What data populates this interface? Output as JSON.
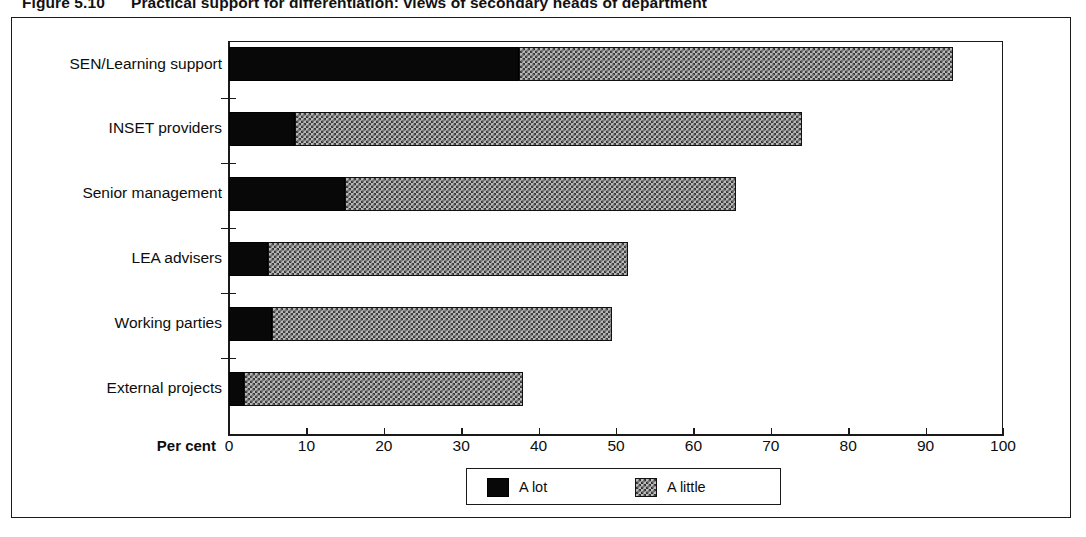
{
  "figure": {
    "number": "Figure 5.10",
    "title": "Practical support for differentiation: views of secondary heads of department"
  },
  "axis": {
    "x_title": "Per cent",
    "x_ticks": [
      "0",
      "10",
      "20",
      "30",
      "40",
      "50",
      "60",
      "70",
      "80",
      "90",
      "100"
    ]
  },
  "legend": {
    "items": [
      {
        "label": "A lot",
        "swatch": "solid-black-swatch"
      },
      {
        "label": "A little",
        "swatch": "checkered-grey-swatch"
      }
    ]
  },
  "chart_data": {
    "type": "bar",
    "orientation": "horizontal",
    "stacked": true,
    "title": "Practical support for differentiation: views of secondary heads of department",
    "xlabel": "Per cent",
    "ylabel": "",
    "xlim": [
      0,
      100
    ],
    "xticks": [
      0,
      10,
      20,
      30,
      40,
      50,
      60,
      70,
      80,
      90,
      100
    ],
    "grid": false,
    "legend_position": "bottom",
    "categories": [
      "SEN/Learning support",
      "INSET providers",
      "Senior management",
      "LEA advisers",
      "Working parties",
      "External projects"
    ],
    "series": [
      {
        "name": "A lot",
        "values": [
          37.5,
          8.5,
          15.0,
          5.0,
          5.5,
          2.0
        ]
      },
      {
        "name": "A little",
        "values": [
          56.0,
          65.5,
          50.5,
          46.5,
          44.0,
          36.0
        ]
      }
    ],
    "totals": [
      93.5,
      74.0,
      65.5,
      51.5,
      49.5,
      38.0
    ]
  }
}
